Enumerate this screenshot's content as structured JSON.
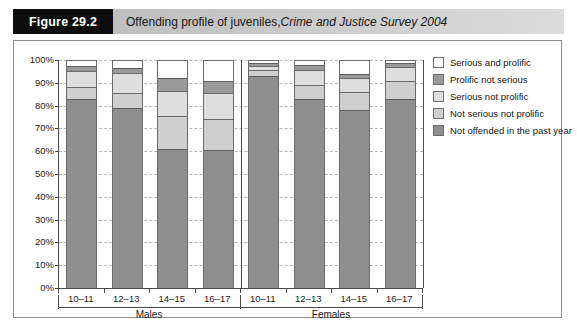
{
  "figure": {
    "badge": "Figure 29.2",
    "title_plain": "Offending profile of juveniles, ",
    "title_italic": "Crime and Justice Survey 2004"
  },
  "chart_data": {
    "type": "bar",
    "stacked": true,
    "stack_mode": "percent",
    "title": "Offending profile of juveniles, Crime and Justice Survey 2004",
    "xlabel": "",
    "ylabel": "",
    "ylim": [
      0,
      100
    ],
    "ytick_labels": [
      "0%",
      "10%",
      "20%",
      "30%",
      "40%",
      "50%",
      "60%",
      "70%",
      "80%",
      "90%",
      "100%"
    ],
    "ytick_values": [
      0,
      10,
      20,
      30,
      40,
      50,
      60,
      70,
      80,
      90,
      100
    ],
    "grid": true,
    "grid_axis": "y",
    "legend_position": "right",
    "group_labels": [
      "Males",
      "Females"
    ],
    "categories": [
      "10–11",
      "12–13",
      "14–15",
      "16–17",
      "10–11",
      "12–13",
      "14–15",
      "16–17"
    ],
    "series": [
      {
        "name": "Not offended in the past year",
        "color": "#8f8f8f",
        "values": [
          83,
          79,
          61,
          60.5,
          93,
          83,
          78,
          83
        ]
      },
      {
        "name": "Not serious not prolific",
        "color": "#cfcfcf",
        "values": [
          5,
          6.5,
          14.5,
          13.5,
          2.5,
          6,
          8,
          8
        ]
      },
      {
        "name": "Serious not prolific",
        "color": "#dedede",
        "values": [
          7,
          9,
          11,
          11.5,
          2,
          6.5,
          6,
          6
        ]
      },
      {
        "name": "Prolific not serious",
        "color": "#9a9a9a",
        "values": [
          2.5,
          2,
          5.5,
          5.5,
          1,
          2.5,
          2,
          1.5
        ]
      },
      {
        "name": "Serious and prolific",
        "color": "#ffffff",
        "values": [
          2.5,
          3.5,
          8,
          9,
          1.5,
          2,
          6,
          1.5
        ]
      }
    ],
    "legend_entries": [
      "Serious and prolific",
      "Prolific not serious",
      "Serious not prolific",
      "Not serious not prolific",
      "Not offended in the past year"
    ]
  }
}
